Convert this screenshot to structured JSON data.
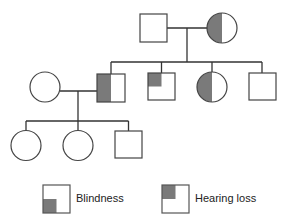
{
  "diagram": {
    "type": "pedigree",
    "shade_color": "#7a7a7a",
    "line_color": "#333333",
    "generations": [
      {
        "id": "I",
        "individuals": [
          {
            "id": "I-1",
            "sex": "male",
            "blindness": false,
            "hearing_loss": false
          },
          {
            "id": "I-2",
            "sex": "female",
            "blindness": true,
            "hearing_loss": true
          }
        ]
      },
      {
        "id": "II",
        "individuals": [
          {
            "id": "II-spouse",
            "sex": "female",
            "blindness": false,
            "hearing_loss": false
          },
          {
            "id": "II-1",
            "sex": "male",
            "blindness": true,
            "hearing_loss": true
          },
          {
            "id": "II-2",
            "sex": "male",
            "blindness": false,
            "hearing_loss": true
          },
          {
            "id": "II-3",
            "sex": "female",
            "blindness": true,
            "hearing_loss": true
          },
          {
            "id": "II-4",
            "sex": "male",
            "blindness": false,
            "hearing_loss": false
          }
        ]
      },
      {
        "id": "III",
        "individuals": [
          {
            "id": "III-1",
            "sex": "female",
            "blindness": false,
            "hearing_loss": false
          },
          {
            "id": "III-2",
            "sex": "female",
            "blindness": false,
            "hearing_loss": false
          },
          {
            "id": "III-3",
            "sex": "male",
            "blindness": false,
            "hearing_loss": false
          }
        ]
      }
    ]
  },
  "legend": {
    "blindness": {
      "label": "Blindness",
      "quadrant": "bottom-left"
    },
    "hearing_loss": {
      "label": "Hearing loss",
      "quadrant": "top-left"
    }
  }
}
